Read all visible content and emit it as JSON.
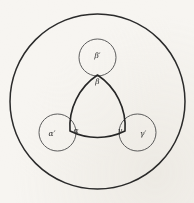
{
  "figure": {
    "kind": "geometric-diagram",
    "background_color": "#f7f5f1",
    "ink_color": "#2a2a2a",
    "outer_circle": {
      "name": "outer-circle",
      "cx": 97.5,
      "cy": 101.5,
      "r": 87.5,
      "stroke": "#2b2b2b"
    },
    "reuleaux_triangle": {
      "name": "curved-triangle",
      "vertices": [
        {
          "id": "top",
          "x": 97.5,
          "y": 75.0
        },
        {
          "id": "bottom-left",
          "x": 70.0,
          "y": 131.0
        },
        {
          "id": "bottom-right",
          "x": 125.0,
          "y": 131.0
        }
      ],
      "arc_radius": 62,
      "stroke": "#262626"
    },
    "vertex_circles": [
      {
        "id": "top",
        "label_outer": "β′",
        "label_inner": "β",
        "cx": 97.5,
        "cy": 57.5,
        "r": 18.5
      },
      {
        "id": "bottom-left",
        "label_outer": "α′",
        "label_inner": "α",
        "cx": 57.5,
        "cy": 132.5,
        "r": 18.5
      },
      {
        "id": "bottom-right",
        "label_outer": "γ′",
        "label_inner": "γ",
        "cx": 137.5,
        "cy": 132.5,
        "r": 18.5
      }
    ],
    "labels": [
      {
        "id": "beta-prime",
        "text": "β′",
        "x": 97.5,
        "y": 56.5
      },
      {
        "id": "beta",
        "text": "β",
        "x": 97.5,
        "y": 82.0
      },
      {
        "id": "alpha-prime",
        "text": "α′",
        "x": 52.0,
        "y": 134.0
      },
      {
        "id": "alpha",
        "text": "α",
        "x": 76.0,
        "y": 131.0
      },
      {
        "id": "gamma",
        "text": "γ",
        "x": 120.0,
        "y": 131.0
      },
      {
        "id": "gamma-prime",
        "text": "γ′",
        "x": 143.0,
        "y": 134.0
      }
    ]
  }
}
